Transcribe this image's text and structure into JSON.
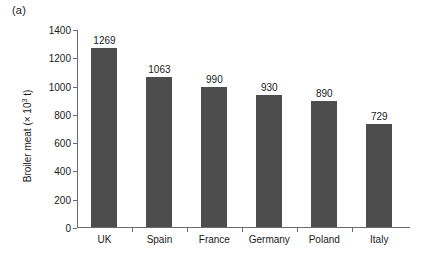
{
  "figure": {
    "panel_label": "(a)"
  },
  "chart_data": {
    "type": "bar",
    "title": "",
    "xlabel": "",
    "ylabel": "Broiler meat (× 10³ t)",
    "ylabel_prefix": "Broiler meat (× 10",
    "ylabel_exponent": "3",
    "ylabel_suffix": " t)",
    "categories": [
      "UK",
      "Spain",
      "France",
      "Germany",
      "Poland",
      "Italy"
    ],
    "values": [
      1269,
      1063,
      990,
      930,
      890,
      729
    ],
    "value_labels": [
      "1269",
      "1063",
      "990",
      "930",
      "890",
      "729"
    ],
    "ylim": [
      0,
      1400
    ],
    "ytick_values": [
      0,
      200,
      400,
      600,
      800,
      1000,
      1200,
      1400
    ],
    "ytick_labels": [
      "0",
      "200",
      "400",
      "600",
      "800",
      "1000",
      "1200",
      "1400"
    ],
    "grid": false,
    "legend": null,
    "bar_color": "#4d4d4d",
    "axis_color": "#6b6b6b",
    "background": "#ffffff"
  }
}
